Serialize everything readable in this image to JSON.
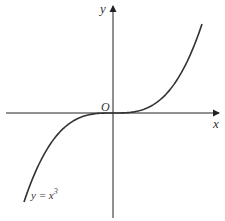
{
  "chart_data": {
    "type": "line",
    "title": "",
    "xlabel": "x",
    "ylabel": "y",
    "origin_label": "O",
    "xlim": [
      -1.1,
      1.1
    ],
    "ylim": [
      -1.2,
      1.2
    ],
    "grid": false,
    "series": [
      {
        "name": "y = x^3",
        "label_base": "y = x",
        "label_exp": "3",
        "function": "cube",
        "x": [
          -1.0,
          -0.9,
          -0.8,
          -0.7,
          -0.6,
          -0.5,
          -0.4,
          -0.3,
          -0.2,
          -0.1,
          0.0,
          0.1,
          0.2,
          0.3,
          0.4,
          0.5,
          0.6,
          0.7,
          0.8,
          0.9,
          1.0
        ],
        "y": [
          -1.0,
          -0.729,
          -0.512,
          -0.343,
          -0.216,
          -0.125,
          -0.064,
          -0.027,
          -0.008,
          -0.001,
          0.0,
          0.001,
          0.008,
          0.027,
          0.064,
          0.125,
          0.216,
          0.343,
          0.512,
          0.729,
          1.0
        ],
        "label_position": "bottom-left"
      }
    ],
    "colors": {
      "axis": "#222222",
      "curve": "#333333",
      "text": "#333333"
    }
  }
}
